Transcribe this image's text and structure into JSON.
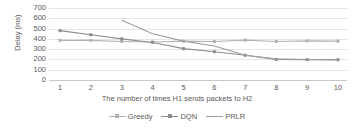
{
  "chart_data": {
    "type": "line",
    "title": "",
    "xlabel": "The number of times H1 sends packets to H2",
    "ylabel": "Delay (ms)",
    "x": [
      1,
      2,
      3,
      4,
      5,
      6,
      7,
      8,
      9,
      10
    ],
    "xticklabels": [
      "1",
      "2",
      "3",
      "4",
      "5",
      "6",
      "7",
      "8",
      "9",
      "10"
    ],
    "yticklabels": [
      "0",
      "100",
      "200",
      "300",
      "400",
      "500",
      "600",
      "700"
    ],
    "yticks": [
      0,
      100,
      200,
      300,
      400,
      500,
      600,
      700
    ],
    "ylim": [
      0,
      700
    ],
    "grid": true,
    "legend_position": "bottom",
    "series": [
      {
        "name": "Greedy",
        "color": "#b3b3b3",
        "marker": "square",
        "x": [
          1,
          2,
          3,
          4,
          5,
          6,
          7,
          8,
          9,
          10
        ],
        "values": [
          385,
          385,
          375,
          370,
          378,
          375,
          388,
          375,
          380,
          378
        ]
      },
      {
        "name": "DQN",
        "color": "#8c8c8c",
        "marker": "square",
        "x": [
          1,
          2,
          3,
          4,
          5,
          6,
          7,
          8,
          9,
          10
        ],
        "values": [
          480,
          440,
          400,
          365,
          305,
          275,
          240,
          200,
          198,
          197
        ]
      },
      {
        "name": "PRLR",
        "color": "#9e9e9e",
        "marker": "none",
        "x": [
          3,
          4,
          5,
          6,
          7,
          8,
          9,
          10
        ],
        "values": [
          580,
          450,
          378,
          330,
          240,
          205,
          200,
          195
        ]
      }
    ]
  },
  "axes": {
    "y_title": "Delay (ms)",
    "x_title": "The number of times H1 sends packets to H2"
  },
  "legend": {
    "items": [
      {
        "label": "Greedy"
      },
      {
        "label": "DQN"
      },
      {
        "label": "PRLR"
      }
    ]
  }
}
